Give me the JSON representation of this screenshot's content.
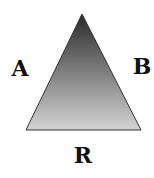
{
  "diagram": {
    "type": "triangle",
    "labels": {
      "left_side": "A",
      "right_side": "B",
      "base": "R"
    },
    "gradient": {
      "top_color": "#2a2a2a",
      "bottom_color": "#d4d4d4"
    },
    "outline_color": "#333333"
  }
}
